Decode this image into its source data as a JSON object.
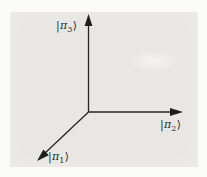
{
  "diagram": {
    "description": "Three-dimensional coordinate frame with basis kets",
    "panel_background": "#e8e7e4",
    "page_background": "#fbfbf9",
    "line_color": "#262626",
    "axes": [
      {
        "id": "pi-1",
        "direction": "down-left",
        "ket_open": "|",
        "symbol": "π",
        "subscript": "1",
        "ket_close": "⟩"
      },
      {
        "id": "pi-2",
        "direction": "right",
        "ket_open": "|",
        "symbol": "π",
        "subscript": "2",
        "ket_close": "⟩"
      },
      {
        "id": "pi-3",
        "direction": "up",
        "ket_open": "|",
        "symbol": "π",
        "subscript": "3",
        "ket_close": "⟩"
      }
    ]
  }
}
